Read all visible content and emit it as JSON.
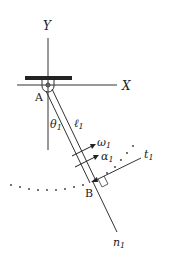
{
  "diagram": {
    "type": "pendulum-link",
    "axes": {
      "x_label": "X",
      "y_label": "Y"
    },
    "points": {
      "pivot": "A",
      "end": "B"
    },
    "angle_label": "θ",
    "angle_sub": "1",
    "length_label": "ℓ",
    "length_sub": "1",
    "angular_velocity_label": "ω",
    "angular_velocity_sub": "1",
    "angular_accel_label": "α",
    "angular_accel_sub": "1",
    "tangent_label": "t",
    "tangent_sub": "1",
    "normal_label": "n",
    "normal_sub": "1",
    "colors": {
      "stroke": "#333333",
      "text": "#222222",
      "background": "#ffffff"
    }
  }
}
